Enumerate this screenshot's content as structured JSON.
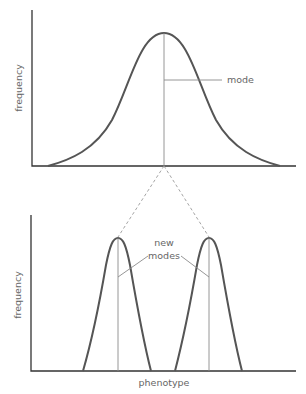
{
  "top_panel": {
    "y_label": "frequency",
    "annotation": "mode",
    "curve": {
      "type": "normal",
      "center_x": 164,
      "peak_y": 33,
      "base_left_x": 48,
      "base_right_x": 280
    }
  },
  "bottom_panel": {
    "y_label": "frequency",
    "x_label": "phenotype",
    "annotation_line1": "new",
    "annotation_line2": "modes",
    "curves": [
      {
        "center_x": 118,
        "peak_y": 238,
        "base_left_x": 83,
        "base_right_x": 151
      },
      {
        "center_x": 209,
        "peak_y": 238,
        "base_left_x": 175,
        "base_right_x": 242
      }
    ]
  },
  "colors": {
    "axis": "#333333",
    "curve": "#555555",
    "guide": "#8a8a8a",
    "text": "#666666"
  }
}
